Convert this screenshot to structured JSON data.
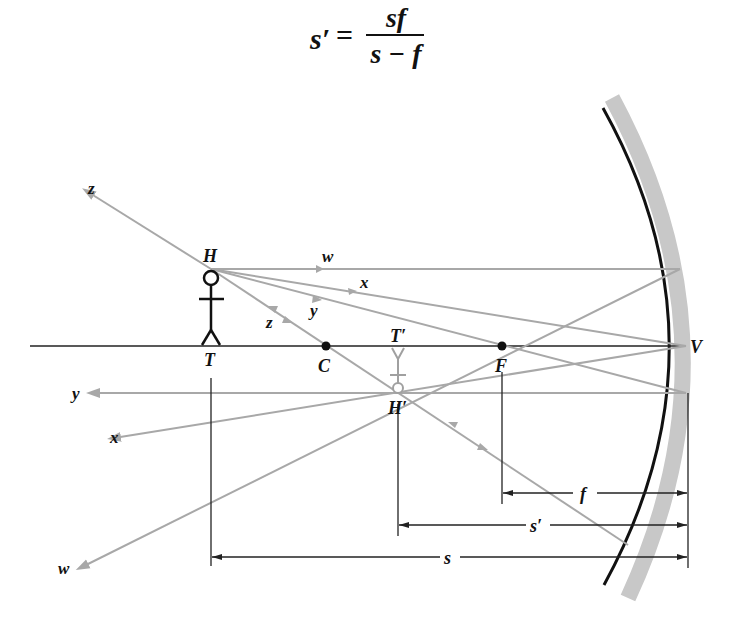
{
  "formula": {
    "lhs": "s′",
    "equals": "=",
    "numerator": "sf",
    "denominator": "s − f"
  },
  "diagram": {
    "type": "concave-mirror-ray-diagram",
    "points": {
      "object_head": "H",
      "object_foot": "T",
      "center_of_curvature": "C",
      "focal_point": "F",
      "vertex": "V",
      "image_foot": "T′",
      "image_head": "H′"
    },
    "rays": {
      "w_incoming": "w",
      "x_incoming": "x",
      "y_incoming": "y",
      "z_incoming": "z",
      "z_outgoing": "z",
      "y_outgoing": "y",
      "x_outgoing": "x",
      "w_outgoing": "w"
    },
    "dimensions": {
      "focal_length": "f",
      "image_distance": "s′",
      "object_distance": "s"
    },
    "colors": {
      "ray": "#a8a8a8",
      "axis": "#222222",
      "mirror": "#111111",
      "mirror_back": "#c8c8c8",
      "image": "#a0a0a0"
    }
  }
}
